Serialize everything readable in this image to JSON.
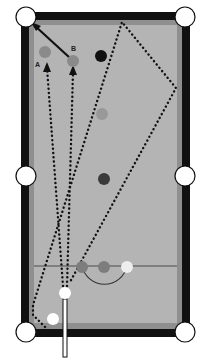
{
  "diagram": {
    "type": "billiards-table-shot-diagram",
    "colors": {
      "rail": "#111111",
      "cushion": "#8f8f8f",
      "cloth": "#b4b4b4",
      "pocket": "#ffffff",
      "white_ball": "#ffffff",
      "light_ball": "#eeeeee",
      "gray_ball": "#8a8a8a",
      "dark_ball": "#3a3a3a",
      "black_ball": "#111111",
      "path": "#111111"
    },
    "labels": {
      "target_a": "A",
      "target_b": "B"
    },
    "balls": [
      {
        "id": "target-a",
        "label": "A",
        "x": 45,
        "y": 52,
        "color": "gray"
      },
      {
        "id": "target-b",
        "label": "B",
        "x": 73,
        "y": 61,
        "color": "gray"
      },
      {
        "id": "black-ball-top",
        "x": 101,
        "y": 56,
        "color": "black"
      },
      {
        "id": "light-gray-ball",
        "x": 102,
        "y": 114,
        "color": "gray"
      },
      {
        "id": "dark-ball-mid",
        "x": 104,
        "y": 179,
        "color": "dark"
      },
      {
        "id": "kitchen-ball-1",
        "x": 82,
        "y": 267,
        "color": "gray"
      },
      {
        "id": "kitchen-ball-2",
        "x": 104,
        "y": 267,
        "color": "gray"
      },
      {
        "id": "kitchen-ball-3",
        "x": 127,
        "y": 267,
        "color": "light"
      },
      {
        "id": "cue-ball",
        "x": 65,
        "y": 293,
        "color": "white"
      },
      {
        "id": "corner-ball",
        "x": 53,
        "y": 319,
        "color": "white"
      }
    ],
    "pockets": [
      {
        "id": "top-left",
        "x": 26,
        "y": 17
      },
      {
        "id": "top-right",
        "x": 185,
        "y": 17
      },
      {
        "id": "mid-left",
        "x": 26,
        "y": 176
      },
      {
        "id": "mid-right",
        "x": 185,
        "y": 176
      },
      {
        "id": "bottom-left",
        "x": 26,
        "y": 332
      },
      {
        "id": "bottom-right",
        "x": 185,
        "y": 332
      }
    ]
  }
}
